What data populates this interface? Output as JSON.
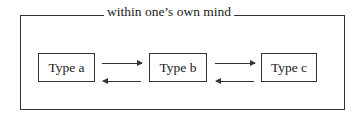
{
  "diagram": {
    "title": "within one’s own mind",
    "nodes": [
      {
        "id": "a",
        "label": "Type a"
      },
      {
        "id": "b",
        "label": "Type b"
      },
      {
        "id": "c",
        "label": "Type c"
      }
    ],
    "edges": [
      {
        "from": "a",
        "to": "b",
        "direction": "forward"
      },
      {
        "from": "b",
        "to": "a",
        "direction": "backward"
      },
      {
        "from": "b",
        "to": "c",
        "direction": "forward"
      },
      {
        "from": "c",
        "to": "b",
        "direction": "backward"
      }
    ]
  }
}
